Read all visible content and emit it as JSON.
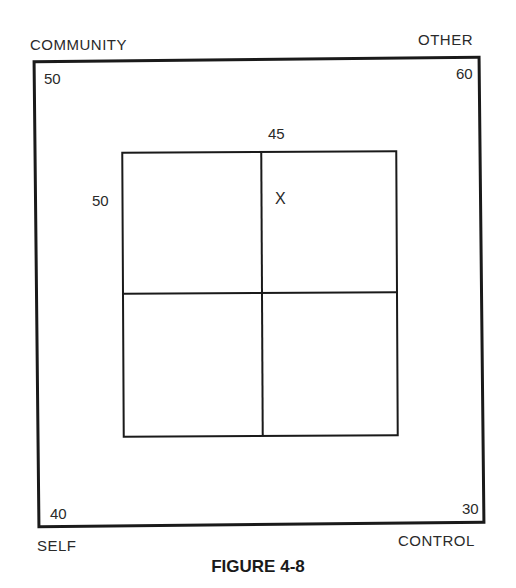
{
  "diagram": {
    "corners": {
      "top_left": {
        "label": "COMMUNITY",
        "value": "50"
      },
      "top_right": {
        "label": "OTHER",
        "value": "60"
      },
      "bottom_left": {
        "label": "SELF",
        "value": "40"
      },
      "bottom_right": {
        "label": "CONTROL",
        "value": "30"
      }
    },
    "inner_grid": {
      "top_value": "45",
      "left_value": "50",
      "quadrants": 4,
      "marker": "X",
      "marker_quadrant": "top-right"
    },
    "caption": "FIGURE 4-8"
  }
}
